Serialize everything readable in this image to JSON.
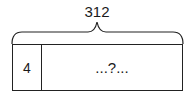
{
  "diagram": {
    "type": "bar-model",
    "total_label": "312",
    "parts": [
      {
        "label": "4"
      },
      {
        "label": "...?..."
      }
    ],
    "line_color": "#222222"
  }
}
